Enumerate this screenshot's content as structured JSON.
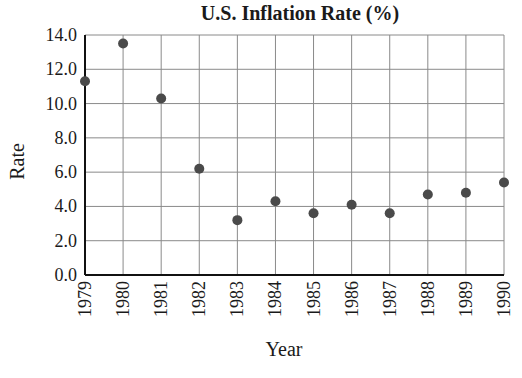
{
  "chart_data": {
    "type": "scatter",
    "title": "U.S. Inflation Rate (%)",
    "xlabel": "Year",
    "ylabel": "Rate",
    "categories": [
      "1979",
      "1980",
      "1981",
      "1982",
      "1983",
      "1984",
      "1985",
      "1986",
      "1987",
      "1988",
      "1989",
      "1990"
    ],
    "values": [
      11.3,
      13.5,
      10.3,
      6.2,
      3.2,
      4.3,
      3.6,
      4.1,
      3.6,
      4.7,
      4.8,
      5.4
    ],
    "yticks": [
      "0.0",
      "2.0",
      "4.0",
      "6.0",
      "8.0",
      "10.0",
      "12.0",
      "14.0"
    ],
    "ylim": [
      0,
      14
    ],
    "grid": true,
    "legend": null,
    "marker_color": "#4a4a4a"
  }
}
